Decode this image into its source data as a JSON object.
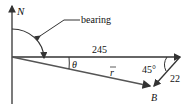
{
  "diagram": {
    "north_label": "N",
    "bearing_label": "bearing",
    "vector_a_length": "245",
    "vector_b_length": "22",
    "angle_label": "45°",
    "theta_label": "θ",
    "resultant_label": "r",
    "point_label": "B",
    "colors": {
      "line": "#333333",
      "resultant": "#555555"
    }
  }
}
